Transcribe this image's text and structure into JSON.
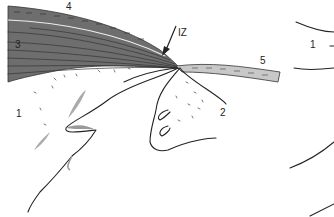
{
  "figure": {
    "type": "anatomical line drawing",
    "labels": {
      "region_1_left": "1",
      "region_2": "2",
      "layer_3": "3",
      "layer_4": "4",
      "layer_5": "5",
      "iz_arrow": "IZ",
      "region_1_right": "1"
    },
    "colors": {
      "dark_band": "#6e6e6e",
      "light_band": "#c8c8c8",
      "ink": "#222222",
      "stipple": "#888888"
    }
  }
}
